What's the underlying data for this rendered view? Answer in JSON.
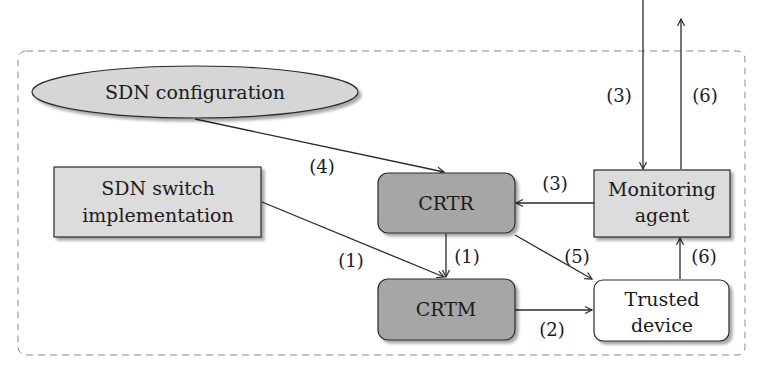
{
  "diagram": {
    "nodes": {
      "sdn_config": {
        "label": "SDN configuration",
        "shape": "ellipse",
        "fill": "#d6d6d6"
      },
      "sdn_switch": {
        "line1": "SDN switch",
        "line2": "implementation",
        "shape": "rectangle",
        "fill": "#dcdcdc"
      },
      "crtr": {
        "label": "CRTR",
        "shape": "rounded-rectangle",
        "fill": "#a6a6a6"
      },
      "crtm": {
        "label": "CRTM",
        "shape": "rounded-rectangle",
        "fill": "#a6a6a6"
      },
      "monitoring_agent": {
        "line1": "Monitoring",
        "line2": "agent",
        "shape": "rectangle",
        "fill": "#dcdcdc"
      },
      "trusted_device": {
        "line1": "Trusted",
        "line2": "device",
        "shape": "rounded-rectangle",
        "fill": "#ffffff"
      }
    },
    "edges": [
      {
        "from": "sdn_config",
        "to": "crtr",
        "label": "(4)"
      },
      {
        "from": "sdn_switch",
        "to": "crtm",
        "label": "(1)"
      },
      {
        "from": "crtr",
        "to": "crtm",
        "label": "(1)"
      },
      {
        "from": "crtr",
        "to": "trusted_device",
        "label": "(5)"
      },
      {
        "from": "crtm",
        "to": "trusted_device",
        "label": "(2)"
      },
      {
        "from": "monitoring_agent",
        "to": "crtr",
        "label": "(3)"
      },
      {
        "from": "trusted_device",
        "to": "monitoring_agent",
        "label": "(6)"
      },
      {
        "from": "external",
        "to": "monitoring_agent",
        "label": "(3)"
      },
      {
        "from": "monitoring_agent",
        "to": "external",
        "label": "(6)"
      }
    ],
    "frame": {
      "style": "dashed",
      "color": "#8a8a8a"
    }
  }
}
